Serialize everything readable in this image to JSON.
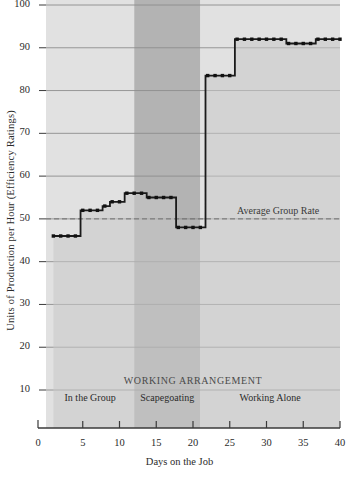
{
  "chart_data": {
    "type": "line",
    "title": "",
    "xlabel": "Days on the Job",
    "ylabel": "Units of Production per Hour (Efficiency Ratings)",
    "xlim": [
      0,
      40
    ],
    "ylim": [
      0,
      100
    ],
    "xticks": [
      0,
      5,
      10,
      15,
      20,
      25,
      30,
      35,
      40
    ],
    "yticks": [
      10,
      20,
      30,
      40,
      50,
      60,
      70,
      80,
      90,
      100
    ],
    "grid": "horizontal",
    "legend": "none",
    "series": [
      {
        "name": "Units of Production per Hour",
        "x": [
          1,
          2,
          3,
          4,
          5,
          6,
          7,
          8,
          9,
          10,
          11,
          12,
          13,
          14,
          15,
          16,
          17,
          18,
          19,
          20,
          21,
          22,
          23,
          24,
          25,
          26,
          27,
          28,
          29,
          30,
          31,
          32,
          33,
          34,
          35,
          36,
          37,
          38,
          39,
          40
        ],
        "values": [
          46,
          46,
          46,
          46,
          52,
          52,
          52,
          53,
          54,
          54,
          56,
          56,
          56,
          55,
          55,
          55,
          55,
          48,
          48,
          48,
          48,
          83.5,
          83.5,
          83.5,
          83.5,
          92,
          92,
          92,
          92,
          92,
          92,
          92,
          91,
          91,
          91,
          91,
          92,
          92,
          92,
          92
        ]
      }
    ],
    "reference_line": {
      "label": "Average Group Rate",
      "value": 50,
      "style": "dashed"
    },
    "bands": [
      {
        "label": "In the Group",
        "x_start": 0,
        "x_end": 12,
        "shade": "#dcdcdc"
      },
      {
        "label": "Scapegoating",
        "x_start": 12,
        "x_end": 21,
        "shade": "#a6a6a6"
      },
      {
        "label": "Working Alone",
        "x_start": 21,
        "x_end": 40,
        "shade": "#dcdcdc"
      }
    ],
    "band_heading": "WORKING ARRANGEMENT",
    "colors": {
      "line": "#1a1a1a",
      "marker": "#111111",
      "area_fill": "#c9c9c9",
      "grid": "#8d8d8d",
      "axis": "#3a3a3a",
      "band_light": "#dcdcdc",
      "band_dark": "#a6a6a6",
      "background": "#ffffff"
    }
  }
}
